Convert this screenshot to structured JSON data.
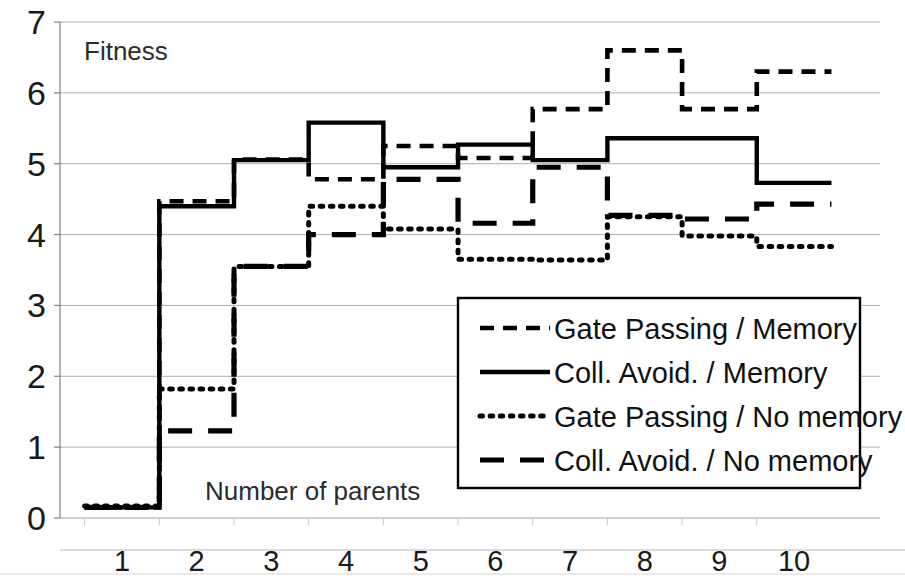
{
  "chart_data": {
    "type": "line",
    "title": "",
    "xlabel": "Number of parents",
    "ylabel": "Fitness",
    "ylim": [
      0,
      7
    ],
    "xlim": [
      0.5,
      10.5
    ],
    "yticks": [
      "0",
      "1",
      "2",
      "3",
      "4",
      "5",
      "6",
      "7"
    ],
    "grid": true,
    "grid_color": "#a6a6a6",
    "line_color": "#000000",
    "legend_position": "inside-bottom-right",
    "categories": [
      1,
      2,
      3,
      4,
      5,
      6,
      7,
      8,
      9,
      10
    ],
    "xticklabels": [
      "1",
      "2",
      "3",
      "4",
      "5",
      "6",
      "7",
      "8",
      "9",
      "10"
    ],
    "step_style": "mid",
    "series": [
      {
        "name": "Gate Passing / Memory",
        "style": "short-dash",
        "values": [
          0.15,
          4.47,
          5.06,
          4.78,
          5.25,
          5.08,
          5.77,
          6.6,
          5.77,
          6.3
        ]
      },
      {
        "name": "Coll. Avoid. / Memory",
        "style": "solid",
        "values": [
          0.15,
          4.4,
          5.05,
          5.58,
          4.95,
          5.27,
          5.05,
          5.36,
          5.36,
          4.73
        ]
      },
      {
        "name": "Gate Passing / No memory",
        "style": "dotted",
        "values": [
          0.17,
          1.82,
          3.55,
          4.4,
          4.08,
          3.65,
          3.64,
          4.25,
          3.98,
          3.83
        ]
      },
      {
        "name": "Coll. Avoid. / No memory",
        "style": "long-dash",
        "values": [
          0.15,
          1.23,
          3.55,
          4.0,
          4.78,
          4.16,
          4.95,
          4.27,
          4.22,
          4.43
        ]
      }
    ]
  },
  "legend": {
    "items": [
      {
        "label": "Gate Passing / Memory",
        "style": "short-dash"
      },
      {
        "label": "Coll. Avoid. / Memory",
        "style": "solid"
      },
      {
        "label": "Gate Passing / No memory",
        "style": "dotted"
      },
      {
        "label": "Coll. Avoid. / No memory",
        "style": "long-dash"
      }
    ]
  }
}
